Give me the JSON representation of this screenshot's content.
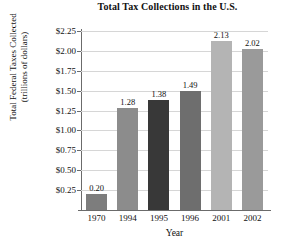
{
  "chart_data": {
    "type": "bar",
    "title": "Total Tax Collections in the U.S.",
    "xlabel": "Year",
    "ylabel_line1": "Total Federal Taxes Collected",
    "ylabel_line2": "(trillions of dollars)",
    "categories": [
      "1970",
      "1994",
      "1995",
      "1996",
      "2001",
      "2002"
    ],
    "values": [
      0.2,
      1.28,
      1.38,
      1.49,
      2.13,
      2.02
    ],
    "value_labels": [
      "0.20",
      "1.28",
      "1.38",
      "1.49",
      "2.13",
      "2.02"
    ],
    "bar_colors": [
      "#7d7d7d",
      "#8c8c8c",
      "#383838",
      "#6e6e6e",
      "#b4b4b4",
      "#9a9a9a"
    ],
    "ylim": [
      0,
      2.25
    ],
    "ytick_values": [
      0.25,
      0.5,
      0.75,
      1.0,
      1.25,
      1.5,
      1.75,
      2.0,
      2.25
    ],
    "ytick_labels": [
      "$0.25",
      "$0.50",
      "$0.75",
      "$1.00",
      "$1.25",
      "$1.50",
      "$1.75",
      "$2.00",
      "$2.25"
    ],
    "grid": true,
    "legend": "none",
    "axis_color": "#6b6b6b",
    "grid_color": "#d6d6d6",
    "background": "#ffffff"
  }
}
